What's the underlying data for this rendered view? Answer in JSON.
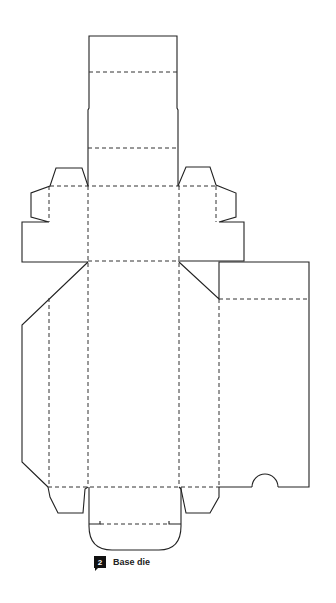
{
  "figure": {
    "type": "packaging die line",
    "caption": {
      "number": "2",
      "label": "Base die"
    },
    "colors": {
      "cut_line": "#222222",
      "fold_line": "#333333",
      "background": "#ffffff",
      "badge": "#111111"
    },
    "legend": {
      "solid": "cut line",
      "dashed": "fold / crease line"
    }
  }
}
